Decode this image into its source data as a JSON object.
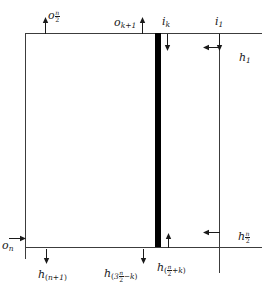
{
  "figure": {
    "type": "technical-line-diagram"
  },
  "colors": {
    "line": "#3c3c3c",
    "bar": "#000000",
    "text": "#1a1a1a",
    "background": "#ffffff"
  },
  "labels": {
    "top_left": {
      "base": "o",
      "sub_num": "n",
      "sub_den": "2",
      "arrow": "up"
    },
    "top_mid": {
      "base": "o",
      "sub": "k+1",
      "arrow": "up"
    },
    "top_ik": {
      "base": "i",
      "sub": "k",
      "arrow": "down"
    },
    "top_i1": {
      "base": "i",
      "sub": "1",
      "arrow": "down"
    },
    "right_h1": {
      "base": "h",
      "sub": "1",
      "arrow": "left"
    },
    "right_hn2": {
      "base": "h",
      "sub_num": "n",
      "sub_den": "2",
      "arrow": "left"
    },
    "left_on": {
      "base": "o",
      "sub": "n",
      "arrow": "right"
    },
    "bottom_hn1": {
      "base": "h",
      "sub_open": "(",
      "sub": "n+1",
      "sub_close": ")",
      "arrow": "down"
    },
    "bottom_h3n2k": {
      "base": "h",
      "sub_open": "(",
      "sub_pre": "3",
      "sub_num": "n",
      "sub_den": "2",
      "sub_post": "−k",
      "sub_close": ")",
      "arrow": "down"
    },
    "bottom_hn2k": {
      "base": "h",
      "sub_open": "(",
      "sub_num": "n",
      "sub_den": "2",
      "sub_post": "+k",
      "sub_close": ")",
      "arrow": "up"
    }
  }
}
